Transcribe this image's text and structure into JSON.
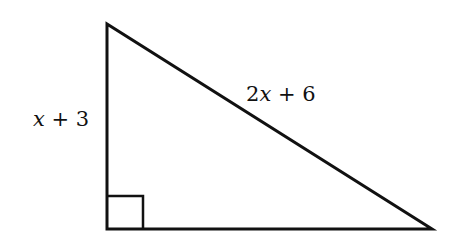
{
  "diagram": {
    "type": "right-triangle",
    "stroke_color": "#111111",
    "vertices": {
      "top": [
        107,
        24
      ],
      "right_angle": [
        107,
        229
      ],
      "bottom_right": [
        432,
        229
      ]
    },
    "right_angle_marker": true,
    "labels": {
      "vertical_leg": {
        "var": "x",
        "rest": " + 3"
      },
      "hypotenuse": {
        "coef": "2",
        "var": "x",
        "rest": " + 6"
      }
    }
  }
}
